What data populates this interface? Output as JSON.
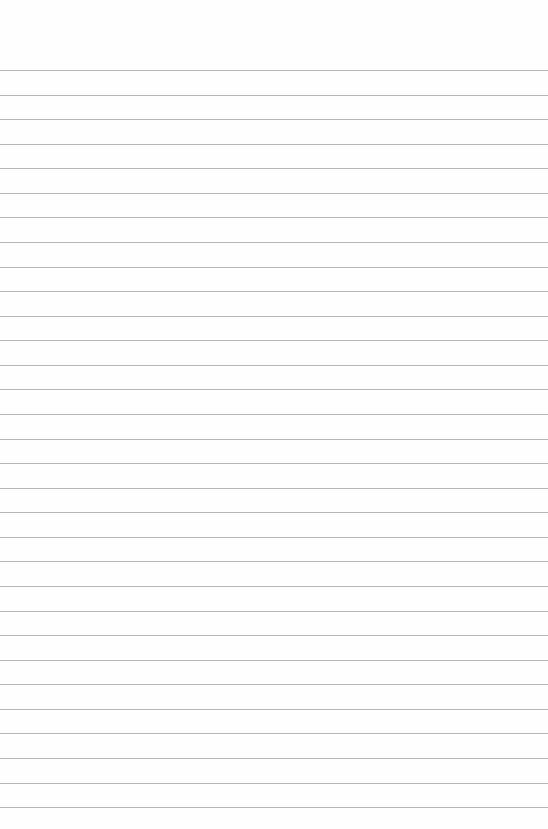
{
  "paper": {
    "type": "lined-paper",
    "background_color": "#fefefe",
    "line_color": "#a9a9a9",
    "line_count": 31,
    "first_line_y": 70,
    "line_spacing": 24.57
  }
}
